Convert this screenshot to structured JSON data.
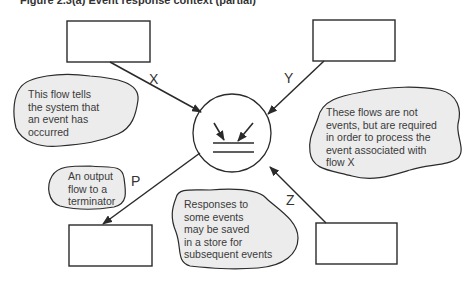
{
  "diagram": {
    "caption": "Figure 2.3(a) Event response context (partial)",
    "process": {
      "symbol": "event-response-bubble"
    },
    "terminators": [
      {
        "id": "top-left",
        "label": ""
      },
      {
        "id": "top-right",
        "label": ""
      },
      {
        "id": "bottom-left",
        "label": ""
      },
      {
        "id": "bottom-right",
        "label": ""
      }
    ],
    "flows": [
      {
        "label": "X",
        "from": "top-left",
        "to": "process"
      },
      {
        "label": "Y",
        "from": "top-right",
        "to": "process"
      },
      {
        "label": "P",
        "from": "process",
        "to": "bottom-left"
      },
      {
        "label": "Z",
        "from": "bottom-right",
        "to": "process"
      }
    ],
    "notes": {
      "x_note": [
        "This flow tells",
        "the system that",
        "an event has",
        "occurred"
      ],
      "y_note": [
        "These flows are not",
        "events, but are required",
        "in order to process the",
        "event associated with",
        "flow X"
      ],
      "p_note": [
        "An output",
        "flow to a",
        "terminator"
      ],
      "store_note": [
        "Responses to",
        "some events",
        "may be saved",
        "in a store for",
        "subsequent events"
      ]
    },
    "colors": {
      "line": "#2a2a2a",
      "note_fill": "#ececec",
      "box_fill": "#ffffff"
    }
  }
}
